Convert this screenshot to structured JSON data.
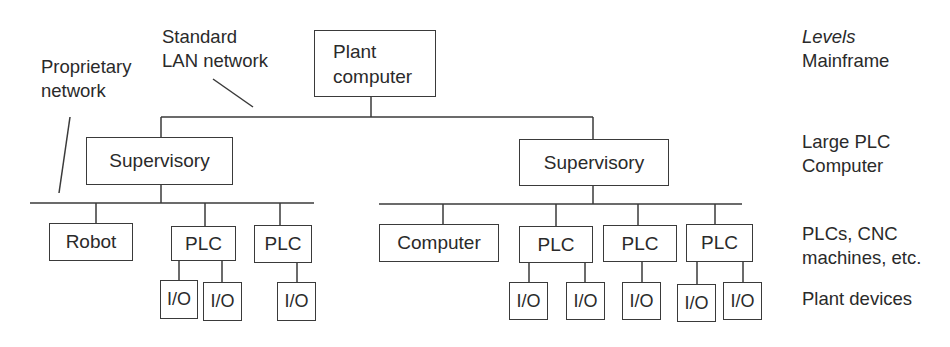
{
  "diagram": {
    "type": "hierarchical-network",
    "top": {
      "line1": "Plant",
      "line2": "computer"
    },
    "annotations": {
      "lan": {
        "line1": "Standard",
        "line2": "LAN network"
      },
      "proprietary": {
        "line1": "Proprietary",
        "line2": "network"
      }
    },
    "supervisory_left": "Supervisory",
    "supervisory_right": "Supervisory",
    "left_nodes": [
      "Robot",
      "PLC",
      "PLC"
    ],
    "left_io": [
      "I/O",
      "I/O",
      "I/O"
    ],
    "right_nodes": [
      "Computer",
      "PLC",
      "PLC",
      "PLC"
    ],
    "right_io": [
      "I/O",
      "I/O",
      "I/O",
      "I/O",
      "I/O"
    ]
  },
  "levels": {
    "heading": "Levels",
    "l1": "Mainframe",
    "l2": {
      "line1": "Large PLC",
      "line2": "Computer"
    },
    "l3": {
      "line1": "PLCs, CNC",
      "line2": "machines, etc."
    },
    "l4": "Plant devices"
  },
  "colors": {
    "line": "#3a3a3a",
    "text": "#2a2a2a",
    "background": "#ffffff"
  }
}
